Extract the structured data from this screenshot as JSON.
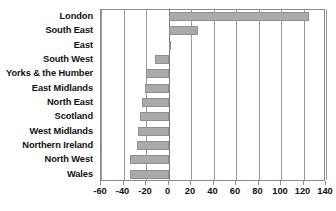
{
  "chart_data": {
    "type": "bar",
    "orientation": "horizontal",
    "title": "",
    "subtitle": "",
    "xlabel": "",
    "ylabel": "",
    "xlim": [
      -60,
      140
    ],
    "ylim": null,
    "grid": true,
    "legend": null,
    "legend_position": "none",
    "xticks": [
      -60,
      -40,
      -20,
      0,
      20,
      40,
      60,
      80,
      100,
      120,
      140
    ],
    "xtick_labels": [
      "-60",
      "-40",
      "-20",
      "0",
      "20",
      "40",
      "60",
      "80",
      "100",
      "120",
      "140"
    ],
    "categories": [
      "London",
      "South East",
      "East",
      "South West",
      "Yorks & the Humber",
      "East Midlands",
      "North East",
      "Scotland",
      "West Midlands",
      "Northern Ireland",
      "North West",
      "Wales"
    ],
    "values": [
      125,
      26,
      2,
      -12,
      -20,
      -21,
      -24,
      -25,
      -27,
      -28,
      -34,
      -34
    ],
    "bar_color": "#aaaaaa",
    "bar_edge_color": "#8f8f8f",
    "gridline_color": "#9a9a9a",
    "axis_color": "#8c8c8c",
    "text_color": "#111111",
    "background_color": "#ffffff"
  }
}
